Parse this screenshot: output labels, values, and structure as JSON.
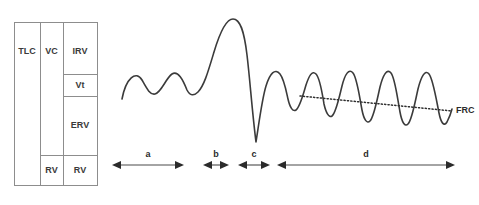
{
  "figure": {
    "stroke_color": "#3b3b3b",
    "table_line_color": "#8d8d8d",
    "arrow_color": "#2b2b2b"
  },
  "volume_table": {
    "columns": [
      {
        "name": "capacity-column",
        "cells": [
          {
            "key": "tlc",
            "label": "TLC",
            "y_top": 22,
            "y_bottom": 185
          }
        ]
      },
      {
        "name": "vc-column",
        "cells": [
          {
            "key": "vc",
            "label": "VC",
            "y_top": 22,
            "y_bottom": 155
          },
          {
            "key": "rv_vc",
            "label": "RV",
            "y_top": 155,
            "y_bottom": 185
          }
        ]
      },
      {
        "name": "volume-column",
        "cells": [
          {
            "key": "irv",
            "label": "IRV",
            "y_top": 22,
            "y_bottom": 74
          },
          {
            "key": "vt",
            "label": "Vt",
            "y_top": 74,
            "y_bottom": 96
          },
          {
            "key": "erv",
            "label": "ERV",
            "y_top": 96,
            "y_bottom": 155
          },
          {
            "key": "rv",
            "label": "RV",
            "y_top": 155,
            "y_bottom": 185
          }
        ]
      }
    ]
  },
  "annotations": {
    "frc_label": "FRC",
    "segments": [
      {
        "key": "a",
        "label": "a",
        "x_start": 112,
        "x_end": 184
      },
      {
        "key": "b",
        "label": "b",
        "x_start": 203,
        "x_end": 229
      },
      {
        "key": "c",
        "label": "c",
        "x_start": 238,
        "x_end": 270
      },
      {
        "key": "d",
        "label": "d",
        "x_start": 277,
        "x_end": 455
      }
    ]
  },
  "chart_data": {
    "type": "line",
    "xlabel": "",
    "ylabel": "Volume",
    "grid": false,
    "legend": null,
    "baseline_breathing_peak_y": 74,
    "baseline_breathing_trough_y": 94,
    "max_inspiration_peak_y": 19,
    "max_expiration_trough_y": 142,
    "frc_line": {
      "x_start": 300,
      "y_start": 96,
      "x_end": 452,
      "y_end": 111
    },
    "trace_path": "M 122,99 C 126,78 136,70 142,80 C 147,89 150,95 155,94 C 161,93 166,78 172,74 C 178,70 183,80 187,90 C 190,96 194,96 198,92 C 204,86 208,72 214,52 C 220,32 226,19 233,19 C 240,19 244,30 247,55 C 250,80 252,110 256,142 C 259,123 262,99 266,86 C 270,73 275,68 280,74 C 284,79 286,90 288,99 C 290,108 293,112 296,110 C 300,107 303,95 306,85 C 309,76 312,70 316,74 C 320,78 322,92 324,104 C 326,113 329,118 332,116 C 336,113 339,98 342,86 C 345,74 349,68 353,73 C 357,78 359,94 362,110 C 364,120 367,124 370,121 C 374,117 377,100 380,87 C 383,75 387,68 391,73 C 395,78 397,96 400,112 C 402,123 405,127 408,124 C 412,120 415,102 418,89 C 421,77 425,69 429,74 C 433,79 436,98 439,113 C 441,123 444,127 447,122 C 449,118 451,113 452,109"
  }
}
